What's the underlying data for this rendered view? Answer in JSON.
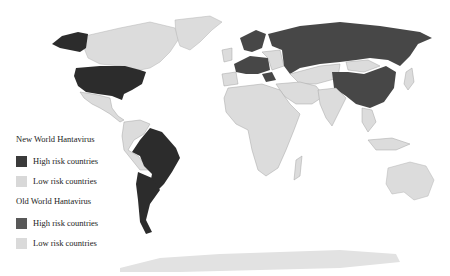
{
  "map": {
    "title": "Hantavirus risk countries",
    "colors": {
      "ocean": "#ffffff",
      "border": "#9a9a9a",
      "new_world_high": "#2c2c2c",
      "new_world_low": "#dcdcdc",
      "old_world_high": "#474747",
      "old_world_low": "#d6d6d6"
    },
    "regions": {
      "new_world_high_risk": [
        "United States",
        "Alaska",
        "Brazil",
        "Argentina",
        "Chile"
      ],
      "new_world_low_risk": [
        "Canada",
        "Greenland",
        "Mexico",
        "Central America",
        "Colombia",
        "Venezuela",
        "Peru",
        "Bolivia",
        "Uruguay"
      ],
      "old_world_high_risk": [
        "Russia",
        "China",
        "Finland",
        "Sweden",
        "France",
        "Germany",
        "Poland",
        "Belgium",
        "Balkans"
      ],
      "old_world_low_risk": [
        "Africa",
        "Middle East",
        "India",
        "Southeast Asia",
        "Australia",
        "Mongolia",
        "Kazakhstan",
        "Antarctica"
      ]
    }
  },
  "legend": {
    "new_world": {
      "title": "New World Hantavirus",
      "items": [
        {
          "label": "High risk countries",
          "color": "#3a3a3a"
        },
        {
          "label": "Low risk countries",
          "color": "#d8d8d8"
        }
      ]
    },
    "old_world": {
      "title": "Old World Hantavirus",
      "items": [
        {
          "label": "High risk countries",
          "color": "#585858"
        },
        {
          "label": "Low risk countries",
          "color": "#dadada"
        }
      ]
    }
  }
}
